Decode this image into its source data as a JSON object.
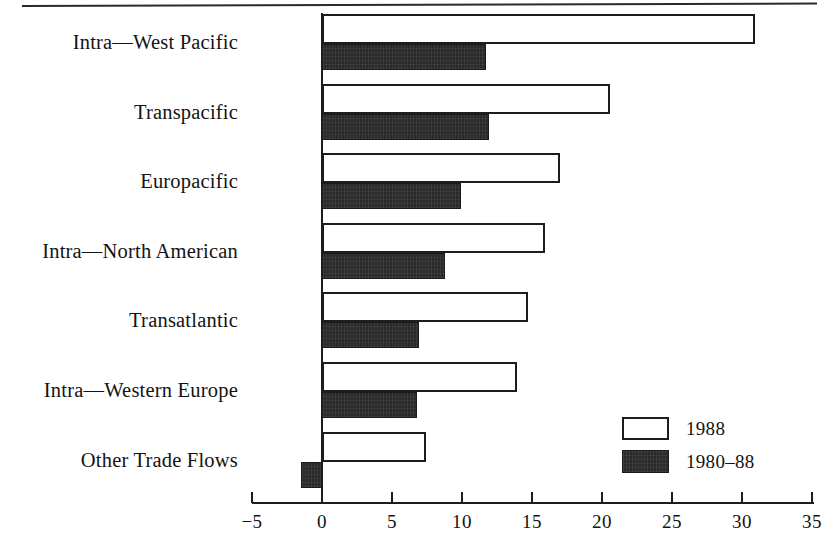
{
  "figure": {
    "has_top_rule": true,
    "background_color": "#ffffff",
    "ink_color": "#1d1d1d"
  },
  "legend": {
    "position": "inside-lower-right",
    "entries": [
      {
        "label": "1988",
        "style": "outlined-white",
        "color": "#ffffff"
      },
      {
        "label": "1980–88",
        "style": "solid-dark",
        "color": "#2a2a2a"
      }
    ]
  },
  "chart_data": {
    "type": "bar",
    "orientation": "horizontal",
    "title": "",
    "subtitle": "",
    "xlabel": "",
    "ylabel": "",
    "xlim": [
      -5,
      35
    ],
    "ylim": null,
    "grid": false,
    "legend_position": "lower right",
    "xticks": [
      -5,
      0,
      5,
      10,
      15,
      20,
      25,
      30,
      35
    ],
    "xtick_labels": [
      "−5",
      "0",
      "5",
      "10",
      "15",
      "20",
      "25",
      "30",
      "35"
    ],
    "categories": [
      "Intra—West Pacific",
      "Transpacific",
      "Europacific",
      "Intra—North American",
      "Transatlantic",
      "Intra—Western Europe",
      "Other Trade Flows"
    ],
    "series": [
      {
        "name": "1988",
        "values": [
          30.9,
          20.6,
          17.0,
          15.9,
          14.7,
          13.9,
          7.4
        ]
      },
      {
        "name": "1980–88",
        "values": [
          11.7,
          11.9,
          9.9,
          8.8,
          6.9,
          6.8,
          -1.5
        ]
      }
    ]
  }
}
